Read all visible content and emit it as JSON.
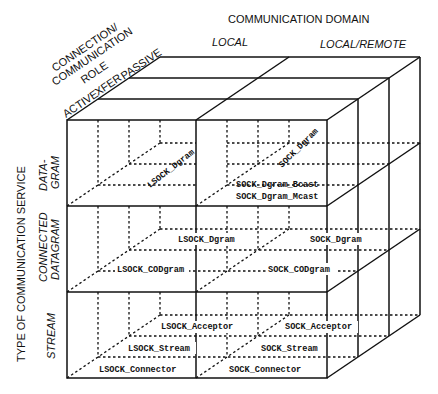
{
  "diagram": {
    "type": "3d-cube-taxonomy",
    "axes": {
      "x": {
        "title": "COMMUNICATION DOMAIN",
        "values": [
          "LOCAL",
          "LOCAL/REMOTE"
        ]
      },
      "z": {
        "title_lines": [
          "CONNECTION/",
          "COMMUNICATION",
          "ROLE"
        ],
        "values": [
          "ACTIVE",
          "XFER",
          "PASSIVE"
        ]
      },
      "y": {
        "title": "TYPE OF COMMUNICATION SERVICE",
        "values": [
          {
            "lines": [
              "DATA-",
              "GRAM"
            ]
          },
          {
            "lines": [
              "CONNECTED",
              "DATAGRAM"
            ]
          },
          {
            "lines": [
              "STREAM"
            ]
          }
        ]
      }
    },
    "cells": {
      "datagram": {
        "local": "LSOCK_Dgram",
        "remote": "SOCK_Dgram",
        "remote_bcast": "SOCK_Dgram_Bcast",
        "remote_mcast": "SOCK_Dgram_Mcast"
      },
      "connected_datagram": {
        "local_dgram": "LSOCK_Dgram",
        "remote_dgram": "SOCK_Dgram",
        "local_codgram": "LSOCK_CODgram",
        "remote_codgram": "SOCK_CODgram"
      },
      "stream": {
        "local_acceptor": "LSOCK_Acceptor",
        "local_stream": "LSOCK_Stream",
        "local_connector": "LSOCK_Connector",
        "remote_acceptor": "SOCK_Acceptor",
        "remote_stream": "SOCK_Stream",
        "remote_connector": "SOCK_Connector"
      }
    }
  }
}
